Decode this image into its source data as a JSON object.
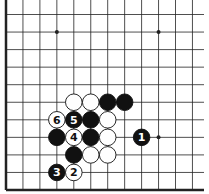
{
  "diagram": {
    "type": "go-board-fragment",
    "grid": {
      "columns": 12,
      "rows": 11,
      "x0": 6,
      "dx": 16.95,
      "y0": 14.5,
      "dy": 17.55,
      "line_end_x": 204,
      "line_top_y": 0,
      "left_edge_thick": true,
      "bottom_edge_thick": true
    },
    "star_points": [
      {
        "col": 3,
        "row": 1
      },
      {
        "col": 9,
        "row": 1
      },
      {
        "col": 9,
        "row": 7
      }
    ],
    "stones": [
      {
        "color": "white",
        "col": 4,
        "row": 5,
        "label": ""
      },
      {
        "color": "white",
        "col": 5,
        "row": 5,
        "label": ""
      },
      {
        "color": "black",
        "col": 6,
        "row": 5,
        "label": ""
      },
      {
        "color": "black",
        "col": 7,
        "row": 5,
        "label": ""
      },
      {
        "color": "white",
        "col": 3,
        "row": 6,
        "label": "6"
      },
      {
        "color": "black",
        "col": 4,
        "row": 6,
        "label": "5"
      },
      {
        "color": "black",
        "col": 5,
        "row": 6,
        "label": ""
      },
      {
        "color": "white",
        "col": 6,
        "row": 6,
        "label": ""
      },
      {
        "color": "black",
        "col": 3,
        "row": 7,
        "label": ""
      },
      {
        "color": "white",
        "col": 4,
        "row": 7,
        "label": "4"
      },
      {
        "color": "black",
        "col": 5,
        "row": 7,
        "label": ""
      },
      {
        "color": "white",
        "col": 6,
        "row": 7,
        "label": ""
      },
      {
        "color": "black",
        "col": 8,
        "row": 7,
        "label": "1"
      },
      {
        "color": "black",
        "col": 4,
        "row": 8,
        "label": ""
      },
      {
        "color": "white",
        "col": 5,
        "row": 8,
        "label": ""
      },
      {
        "color": "white",
        "col": 6,
        "row": 8,
        "label": ""
      },
      {
        "color": "black",
        "col": 3,
        "row": 9,
        "label": "3"
      },
      {
        "color": "white",
        "col": 4,
        "row": 9,
        "label": "2"
      }
    ],
    "colors": {
      "line": "#222222",
      "black_stone": "#111111",
      "white_stone": "#ffffff",
      "background": "#ffffff"
    }
  }
}
